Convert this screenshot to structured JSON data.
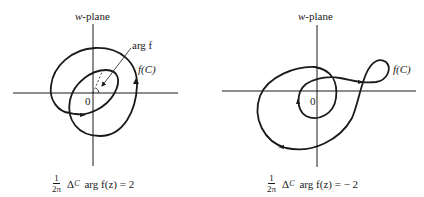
{
  "figure": {
    "left_panel": {
      "plane_label_var": "w",
      "plane_label_rest": "-plane",
      "origin_label": "0",
      "curve_label": "f(C)",
      "annotation_label": "arg f",
      "formula": {
        "frac_num": "1",
        "frac_den": "2π",
        "delta": "Δ",
        "delta_sub": "C",
        "expr": "arg f(z) = 2"
      },
      "winding_number": 2
    },
    "right_panel": {
      "plane_label_var": "w",
      "plane_label_rest": "-plane",
      "origin_label": "0",
      "curve_label": "f(C)",
      "formula": {
        "frac_num": "1",
        "frac_den": "2π",
        "delta": "Δ",
        "delta_sub": "C",
        "expr": "arg f(z) = − 2"
      },
      "winding_number": -2
    },
    "colors": {
      "ink": "#1a1a1a",
      "background": "#ffffff"
    }
  }
}
